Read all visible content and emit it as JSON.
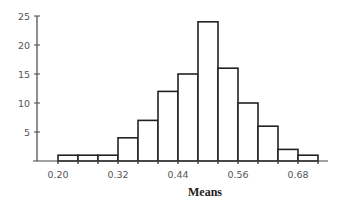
{
  "chart_data": {
    "type": "bar",
    "subtype": "histogram",
    "title": "",
    "xlabel": "Means",
    "ylabel": "",
    "bin_edges": [
      0.2,
      0.24,
      0.28,
      0.32,
      0.36,
      0.4,
      0.44,
      0.48,
      0.52,
      0.56,
      0.6,
      0.64,
      0.68,
      0.72
    ],
    "categories": [
      "0.20-0.24",
      "0.24-0.28",
      "0.28-0.32",
      "0.32-0.36",
      "0.36-0.40",
      "0.40-0.44",
      "0.44-0.48",
      "0.48-0.52",
      "0.52-0.56",
      "0.56-0.60",
      "0.60-0.64",
      "0.64-0.68",
      "0.68-0.72"
    ],
    "values": [
      1,
      1,
      1,
      4,
      7,
      12,
      15,
      24,
      16,
      10,
      6,
      2,
      1
    ],
    "ylim": [
      0,
      25
    ],
    "xlim": [
      0.17,
      0.74
    ],
    "yticks": [
      5,
      10,
      15,
      20,
      25
    ],
    "xticks": [
      0.2,
      0.32,
      0.44,
      0.56,
      0.68
    ],
    "xtick_labels": [
      "0.20",
      "0.32",
      "0.44",
      "0.56",
      "0.68"
    ],
    "ytick_labels": [
      "5",
      "10",
      "15",
      "20",
      "25"
    ],
    "grid": false,
    "legend": null,
    "bar_fill": "#ffffff",
    "bar_stroke": "#222222",
    "axis_color": "#444444"
  }
}
